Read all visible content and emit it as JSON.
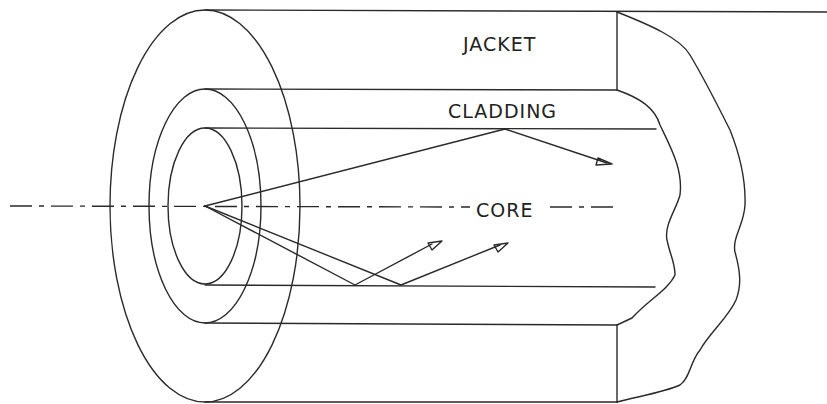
{
  "figure": {
    "labels": {
      "jacket": "JACKET",
      "cladding": "CLADDING",
      "core": "CORE"
    },
    "colors": {
      "line": "#2a2a2a",
      "background": "#ffffff"
    },
    "layers": [
      "jacket",
      "cladding",
      "core"
    ],
    "rays": [
      {
        "name": "upper-ray",
        "from": "origin",
        "reflects_at": "core-cladding-top",
        "arrow": "open-triangle"
      },
      {
        "name": "lower-ray-1",
        "from": "origin",
        "reflects_at": "core-cladding-bottom",
        "arrow": "open-triangle"
      },
      {
        "name": "lower-ray-2",
        "from": "origin",
        "reflects_at": "core-cladding-bottom",
        "arrow": "open-triangle"
      }
    ]
  }
}
